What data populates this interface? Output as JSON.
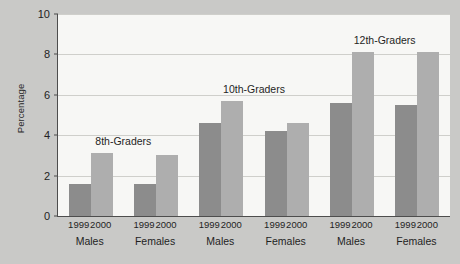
{
  "chart_data": {
    "type": "bar",
    "title": "",
    "xlabel": "",
    "ylabel": "Percentage",
    "ylim": [
      0,
      10
    ],
    "yticks": [
      0,
      2,
      4,
      6,
      8,
      10
    ],
    "ytick_labels": [
      "0",
      "2",
      "4",
      "6",
      "8",
      "10"
    ],
    "grid": true,
    "legend_position": "none",
    "categories": [
      "8th-Graders Males",
      "8th-Graders Females",
      "10th-Graders Males",
      "10th-Graders Females",
      "12th-Graders Males",
      "12th-Graders Females"
    ],
    "series": [
      {
        "name": "1999",
        "values": [
          1.6,
          1.6,
          4.6,
          4.2,
          5.6,
          5.5
        ],
        "color": "#8c8c8c"
      },
      {
        "name": "2000",
        "values": [
          3.1,
          3.0,
          5.7,
          4.6,
          8.1,
          8.1
        ],
        "color": "#aeaeae"
      }
    ],
    "groups": [
      {
        "annotation": "8th-Graders",
        "genders": [
          {
            "name": "Males",
            "bars": [
              {
                "year": "1999",
                "value": 1.6
              },
              {
                "year": "2000",
                "value": 3.1
              }
            ]
          },
          {
            "name": "Females",
            "bars": [
              {
                "year": "1999",
                "value": 1.6
              },
              {
                "year": "2000",
                "value": 3.0
              }
            ]
          }
        ]
      },
      {
        "annotation": "10th-Graders",
        "genders": [
          {
            "name": "Males",
            "bars": [
              {
                "year": "1999",
                "value": 4.6
              },
              {
                "year": "2000",
                "value": 5.7
              }
            ]
          },
          {
            "name": "Females",
            "bars": [
              {
                "year": "1999",
                "value": 4.2
              },
              {
                "year": "2000",
                "value": 4.6
              }
            ]
          }
        ]
      },
      {
        "annotation": "12th-Graders",
        "genders": [
          {
            "name": "Males",
            "bars": [
              {
                "year": "1999",
                "value": 5.6
              },
              {
                "year": "2000",
                "value": 8.1
              }
            ]
          },
          {
            "name": "Females",
            "bars": [
              {
                "year": "1999",
                "value": 5.5
              },
              {
                "year": "2000",
                "value": 8.1
              }
            ]
          }
        ]
      }
    ],
    "colors": {
      "background": "#c9c9c7",
      "plot_background": "#f7f7f5",
      "axis": "#4d4d4d",
      "gridline": "#cfcfcb",
      "bar_1999": "#8c8c8c",
      "bar_2000": "#aeaeae",
      "text": "#1f1f1f"
    }
  }
}
